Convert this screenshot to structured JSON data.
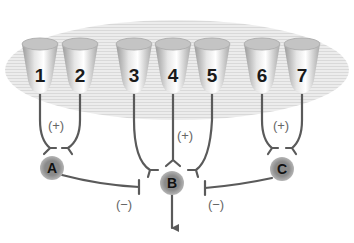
{
  "diagram": {
    "type": "neural-circuit",
    "receptors": [
      {
        "id": "1",
        "label": "1"
      },
      {
        "id": "2",
        "label": "2"
      },
      {
        "id": "3",
        "label": "3"
      },
      {
        "id": "4",
        "label": "4"
      },
      {
        "id": "5",
        "label": "5"
      },
      {
        "id": "6",
        "label": "6"
      },
      {
        "id": "7",
        "label": "7"
      }
    ],
    "nodes": [
      {
        "id": "A",
        "label": "A"
      },
      {
        "id": "B",
        "label": "B"
      },
      {
        "id": "C",
        "label": "C"
      }
    ],
    "excitatory": [
      {
        "from": [
          "1",
          "2"
        ],
        "to": "A",
        "label": "(+)"
      },
      {
        "from": [
          "3",
          "4",
          "5"
        ],
        "to": "B",
        "label": "(+)"
      },
      {
        "from": [
          "6",
          "7"
        ],
        "to": "C",
        "label": "(+)"
      }
    ],
    "inhibitory": [
      {
        "from": "A",
        "to": "B",
        "label": "(−)"
      },
      {
        "from": "C",
        "to": "B",
        "label": "(−)"
      }
    ],
    "output": {
      "from": "B",
      "direction": "down"
    },
    "colors": {
      "background_ellipse": "#e2e2e2",
      "cup_fill": "#c8c8c8",
      "node_fill": "#8f8f8f",
      "wire": "#5a5a5a"
    }
  }
}
